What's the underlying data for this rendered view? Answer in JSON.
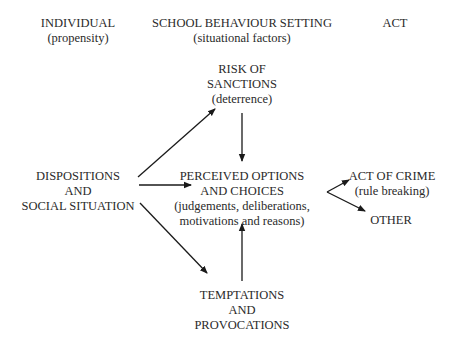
{
  "headers": {
    "individual": {
      "title": "INDIVIDUAL",
      "subtitle": "(propensity)"
    },
    "setting": {
      "title": "SCHOOL BEHAVIOUR SETTING",
      "subtitle": "(situational factors)"
    },
    "act": {
      "title": "ACT"
    }
  },
  "nodes": {
    "risk": {
      "lines": [
        "RISK OF",
        "SANCTIONS",
        "(deterrence)"
      ]
    },
    "dispositions": {
      "lines": [
        "DISPOSITIONS",
        "AND",
        "SOCIAL SITUATION"
      ]
    },
    "perceived": {
      "lines": [
        "PERCEIVED OPTIONS",
        "AND CHOICES",
        "(judgements, deliberations,",
        "motivations and reasons)"
      ]
    },
    "crime": {
      "lines": [
        "ACT OF CRIME",
        "(rule breaking)"
      ]
    },
    "other": {
      "lines": [
        "OTHER"
      ]
    },
    "temptations": {
      "lines": [
        "TEMPTATIONS",
        "AND",
        "PROVOCATIONS"
      ]
    }
  },
  "edges": [
    {
      "from": "dispositions",
      "to": "risk"
    },
    {
      "from": "dispositions",
      "to": "perceived"
    },
    {
      "from": "dispositions",
      "to": "temptations"
    },
    {
      "from": "risk",
      "to": "perceived"
    },
    {
      "from": "temptations",
      "to": "perceived"
    },
    {
      "from": "perceived",
      "to": "crime"
    },
    {
      "from": "perceived",
      "to": "other"
    }
  ],
  "colors": {
    "line": "#1a1a1a",
    "text": "#2a2a2a"
  }
}
